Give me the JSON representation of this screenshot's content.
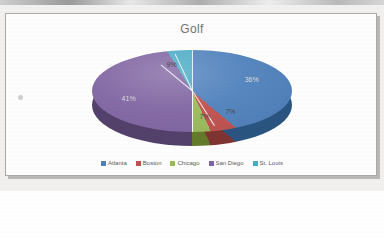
{
  "chart": {
    "title": "Golf"
  },
  "chart_data": {
    "type": "pie",
    "title": "Golf",
    "categories": [
      "Atlanta",
      "Boston",
      "Chicago",
      "San Diego",
      "St. Louis"
    ],
    "values": [
      36,
      7,
      7,
      41,
      9
    ],
    "labels": [
      "36%",
      "7%",
      "7%",
      "41%",
      "9%"
    ],
    "colors": [
      "#4F81BD",
      "#C0504D",
      "#9BBB59",
      "#8064A2",
      "#4BACC6"
    ],
    "legend_position": "bottom",
    "data_labels": true,
    "three_d": true
  },
  "legend": {
    "items": [
      {
        "label": "Atlanta",
        "color": "#4F81BD"
      },
      {
        "label": "Boston",
        "color": "#C0504D"
      },
      {
        "label": "Chicago",
        "color": "#9BBB59"
      },
      {
        "label": "San Diego",
        "color": "#8064A2"
      },
      {
        "label": "St. Louis",
        "color": "#4BACC6"
      }
    ]
  }
}
